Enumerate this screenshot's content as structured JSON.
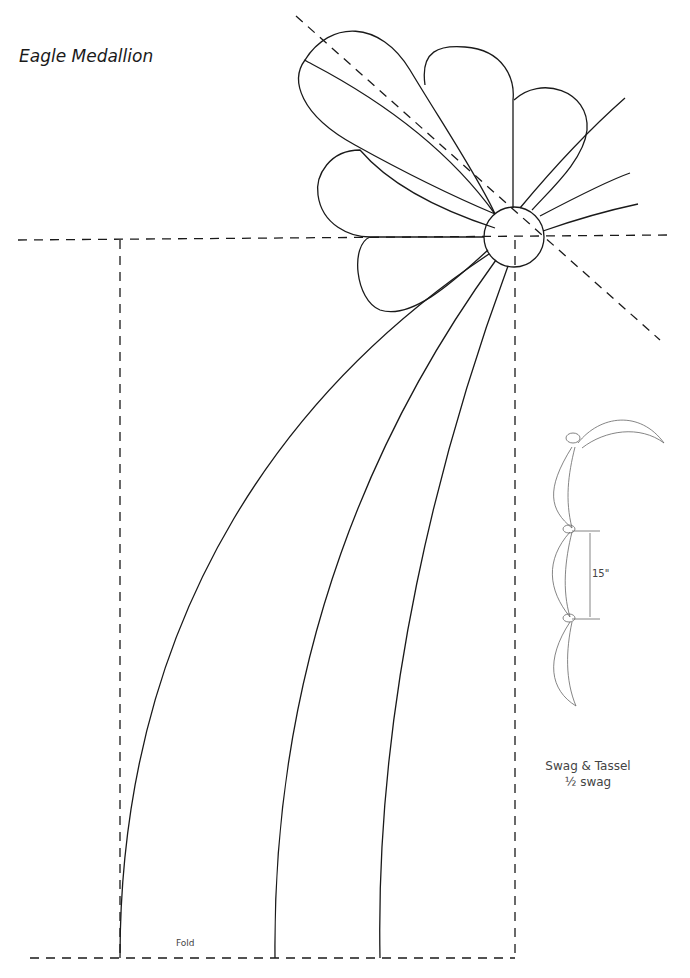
{
  "title": "Eagle Medallion",
  "labels": {
    "fold": "Fold",
    "swag_title": "Swag & Tassel",
    "swag_sub": "½ swag",
    "dimension": "15\""
  },
  "colors": {
    "line": "#1a1a1a",
    "thin_line": "#666666",
    "background": "#ffffff"
  }
}
